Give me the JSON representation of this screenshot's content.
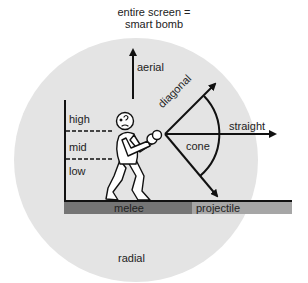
{
  "diagram": {
    "title_line1": "entire screen =",
    "title_line2": "smart bomb",
    "labels": {
      "aerial": "aerial",
      "diagonal": "diagonal",
      "straight": "straight",
      "cone": "cone",
      "high": "high",
      "mid": "mid",
      "low": "low",
      "melee": "melee",
      "projectile": "projectile",
      "radial": "radial"
    },
    "colors": {
      "radial_circle": "#e4e4e4",
      "melee_bar": "#757575",
      "projectile_bar": "#a6a6a6",
      "lines": "#111111"
    }
  }
}
